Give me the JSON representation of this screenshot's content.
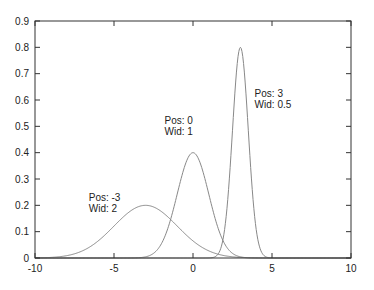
{
  "chart_data": {
    "type": "line",
    "title": "",
    "xlabel": "",
    "ylabel": "",
    "xlim": [
      -10,
      10
    ],
    "ylim": [
      0,
      0.9
    ],
    "x_ticks": [
      -10,
      -5,
      0,
      5,
      10
    ],
    "x_tick_labels": [
      "-10",
      "-5",
      "0",
      "5",
      "10"
    ],
    "y_ticks": [
      0,
      0.1,
      0.2,
      0.3,
      0.4,
      0.5,
      0.6,
      0.7,
      0.8,
      0.9
    ],
    "y_tick_labels": [
      "0",
      "0.1",
      "0.2",
      "0.3",
      "0.4",
      "0.5",
      "0.6",
      "0.7",
      "0.8",
      "0.9"
    ],
    "grid": false,
    "legend": null,
    "line_color": "#888888",
    "series": [
      {
        "name": "Pos: -3, Wid: 2",
        "function": "gaussian",
        "pos": -3,
        "wid": 2,
        "peak": 0.2
      },
      {
        "name": "Pos: 0, Wid: 1",
        "function": "gaussian",
        "pos": 0,
        "wid": 1,
        "peak": 0.4
      },
      {
        "name": "Pos: 3, Wid: 0.5",
        "function": "gaussian",
        "pos": 3,
        "wid": 0.5,
        "peak": 0.8
      }
    ],
    "annotations": [
      {
        "line1": "Pos: -3",
        "line2": "Wid: 2",
        "x": -6.6,
        "y": 0.215
      },
      {
        "line1": "Pos: 0",
        "line2": "Wid: 1",
        "x": -1.8,
        "y": 0.51
      },
      {
        "line1": "Pos: 3",
        "line2": "Wid: 0.5",
        "x": 3.9,
        "y": 0.61
      }
    ]
  }
}
